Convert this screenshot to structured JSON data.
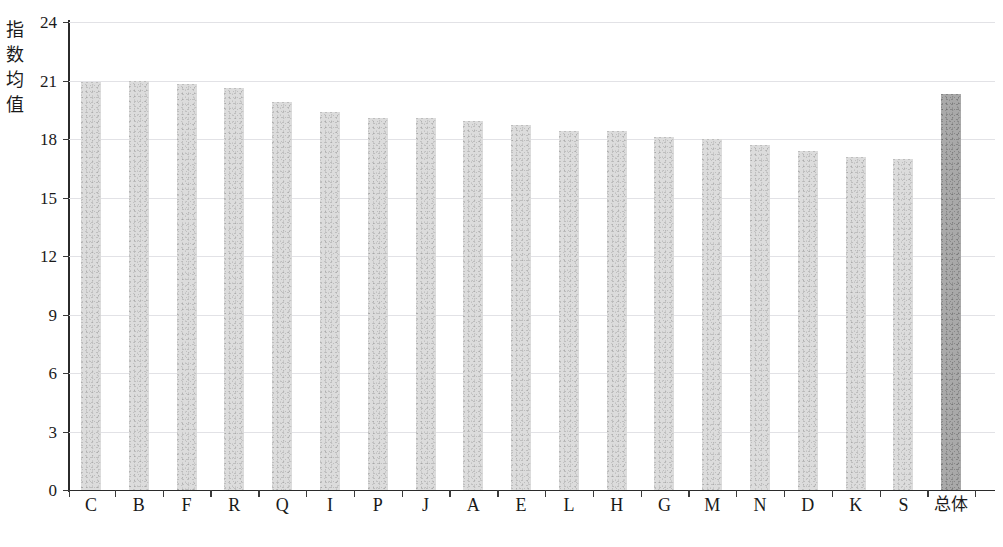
{
  "chart_data": {
    "type": "bar",
    "title": "",
    "subtitle": "",
    "xlabel": "",
    "ylabel": "指数均值",
    "ylim": [
      0,
      24
    ],
    "ytick_labels": [
      "0",
      "3",
      "6",
      "9",
      "12",
      "15",
      "18",
      "21",
      "24"
    ],
    "yticks": [
      0,
      3,
      6,
      9,
      12,
      15,
      18,
      21,
      24
    ],
    "grid": true,
    "legend": "none",
    "categories": [
      "C",
      "B",
      "F",
      "R",
      "Q",
      "I",
      "P",
      "J",
      "A",
      "E",
      "L",
      "H",
      "G",
      "M",
      "N",
      "D",
      "K",
      "S",
      "总体"
    ],
    "values": [
      20.9,
      21.0,
      20.8,
      20.6,
      19.9,
      19.4,
      19.1,
      19.1,
      18.9,
      18.7,
      18.4,
      18.4,
      18.1,
      18.0,
      17.7,
      17.4,
      17.1,
      17.0,
      20.3
    ],
    "series": [
      {
        "name": "指数均值",
        "values": [
          20.9,
          21.0,
          20.8,
          20.6,
          19.9,
          19.4,
          19.1,
          19.1,
          18.9,
          18.7,
          18.4,
          18.4,
          18.1,
          18.0,
          17.7,
          17.4,
          17.1,
          17.0,
          20.3
        ]
      }
    ],
    "highlighted_category": "总体",
    "colors": {
      "bar": "#dcdcdc",
      "bar_highlight": "#a9a9a9",
      "axis": "#2b2b2b",
      "gridline": "#e2e2e6",
      "text": "#1a1a1a"
    }
  }
}
